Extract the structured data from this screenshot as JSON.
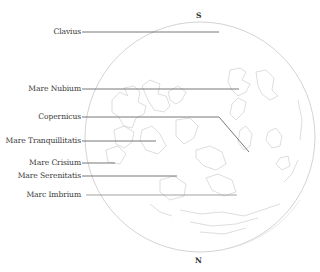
{
  "diagram": {
    "compass": {
      "top": "S",
      "bottom": "N"
    },
    "moon": {
      "cx": 200,
      "cy": 137,
      "r": 115,
      "outline_color": "#c8c8c8",
      "terrain_color": "#cfcfcf"
    },
    "leader_color": "#555555",
    "labels": [
      {
        "text": "Clavius",
        "y": 32,
        "line_end_x": 219
      },
      {
        "text": "Mare Nubium",
        "y": 89,
        "line_end_x": 239
      },
      {
        "text": "Copernicus",
        "y": 117,
        "line_end_x": 219,
        "bend_to": [
          249,
          152
        ]
      },
      {
        "text": "Mare Tranquillitatis",
        "y": 141,
        "line_end_x": 156
      },
      {
        "text": "Mare Crisium",
        "y": 163,
        "line_end_x": 115
      },
      {
        "text": "Mare Serenitatis",
        "y": 176,
        "line_end_x": 177
      },
      {
        "text": "Marc Imbrium",
        "y": 195,
        "line_end_x": 237
      }
    ]
  }
}
